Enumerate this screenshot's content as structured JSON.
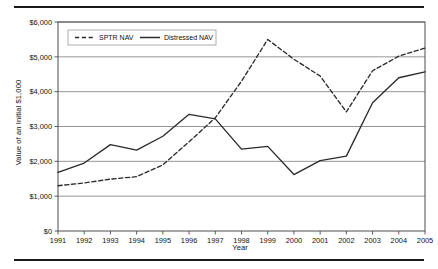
{
  "figure": {
    "has_top_rule": true,
    "has_bottom_rule": true
  },
  "axis": {
    "y_title": "Value of an Initial $1,000",
    "x_title": "Year"
  },
  "legend": {
    "entries": [
      {
        "label": "SPTR NAV",
        "style": "dashed"
      },
      {
        "label": "Distressed NAV",
        "style": "solid"
      }
    ]
  },
  "ticks": {
    "y": [
      "$0",
      "$1,000",
      "$2,000",
      "$3,000",
      "$4,000",
      "$5,000",
      "$6,000"
    ],
    "x": [
      "1991",
      "1992",
      "1993",
      "1994",
      "1995",
      "1996",
      "1997",
      "1998",
      "1999",
      "2000",
      "2001",
      "2002",
      "2003",
      "2004",
      "2005"
    ]
  },
  "colors": {
    "line": "#2b2b2b",
    "grid": "#8a8a8a",
    "frame": "#4d4d4d",
    "rule": "#1a1a1a",
    "background": "#ffffff"
  },
  "chart_data": {
    "type": "line",
    "title": "",
    "xlabel": "Year",
    "ylabel": "Value of an Initial $1,000",
    "x": [
      1991,
      1992,
      1993,
      1994,
      1995,
      1996,
      1997,
      1998,
      1999,
      2000,
      2001,
      2002,
      2003,
      2004,
      2005
    ],
    "categories": [
      "1991",
      "1992",
      "1993",
      "1994",
      "1995",
      "1996",
      "1997",
      "1998",
      "1999",
      "2000",
      "2001",
      "2002",
      "2003",
      "2004",
      "2005"
    ],
    "ylim": [
      0,
      6000
    ],
    "ytick_values": [
      0,
      1000,
      2000,
      3000,
      4000,
      5000,
      6000
    ],
    "grid": true,
    "legend_position": "top-left-inside",
    "series": [
      {
        "name": "SPTR NAV",
        "style": "dashed",
        "values": [
          1300,
          1380,
          1490,
          1560,
          1900,
          2560,
          3250,
          4300,
          5500,
          4930,
          4450,
          3420,
          4600,
          5020,
          5250
        ]
      },
      {
        "name": "Distressed NAV",
        "style": "solid",
        "values": [
          1680,
          1950,
          2480,
          2320,
          2720,
          3350,
          3220,
          2350,
          2430,
          1620,
          2020,
          2150,
          3680,
          4400,
          4570
        ]
      }
    ]
  }
}
